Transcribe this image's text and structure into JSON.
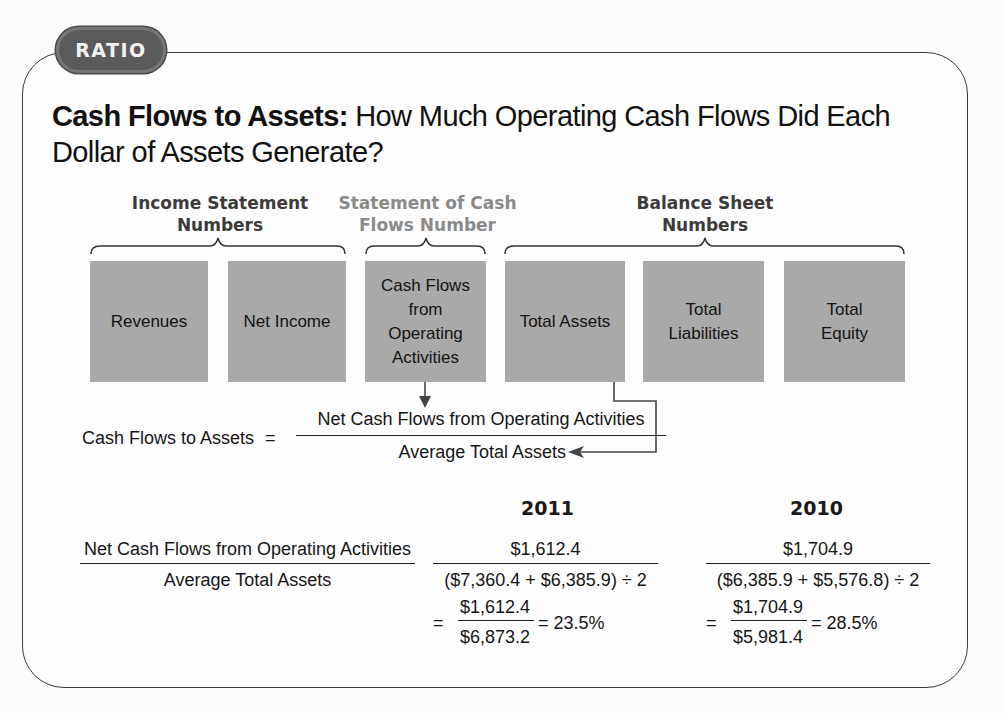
{
  "badge": {
    "label": "RATIO"
  },
  "title": {
    "bold": "Cash Flows to Assets:",
    "regular": " How Much Operating Cash Flows Did Each Dollar of Assets Generate?"
  },
  "groups": [
    {
      "label_line1": "Income Statement",
      "label_line2": "Numbers",
      "emphasis": "dark"
    },
    {
      "label_line1": "Statement of Cash",
      "label_line2": "Flows Number",
      "emphasis": "light"
    },
    {
      "label_line1": "Balance Sheet",
      "label_line2": "Numbers",
      "emphasis": "dark"
    }
  ],
  "boxes": [
    {
      "label": "Revenues"
    },
    {
      "label": "Net Income"
    },
    {
      "label": "Cash Flows from Operating Activities",
      "line1": "Cash Flows",
      "line2": "from",
      "line3": "Operating",
      "line4": "Activities"
    },
    {
      "label": "Total Assets"
    },
    {
      "label": "Total Liabilities",
      "line1": "Total",
      "line2": "Liabilities"
    },
    {
      "label": "Total Equity",
      "line1": "Total",
      "line2": "Equity"
    }
  ],
  "formula": {
    "lhs": "Cash Flows to Assets",
    "equals": "=",
    "numerator": "Net Cash Flows from Operating Activities",
    "denominator": "Average Total Assets"
  },
  "calculation": {
    "label_numerator": "Net Cash Flows from Operating Activities",
    "label_denominator": "Average Total Assets",
    "years": [
      {
        "year": "2011",
        "numerator": "$1,612.4",
        "denominator": "($7,360.4 + $6,385.9) ÷ 2",
        "equals": "=",
        "result_numerator": "$1,612.4",
        "result_denominator": "$6,873.2",
        "result": "= 23.5%"
      },
      {
        "year": "2010",
        "numerator": "$1,704.9",
        "denominator": "($6,385.9 + $5,576.8) ÷ 2",
        "equals": "=",
        "result_numerator": "$1,704.9",
        "result_denominator": "$5,981.4",
        "result": "= 28.5%"
      }
    ]
  },
  "colors": {
    "box_fill": "#a9a9a9",
    "badge_fill": "#5b5b5b",
    "frame_stroke": "#3a3a3a",
    "light_label": "#8a8a8a"
  }
}
